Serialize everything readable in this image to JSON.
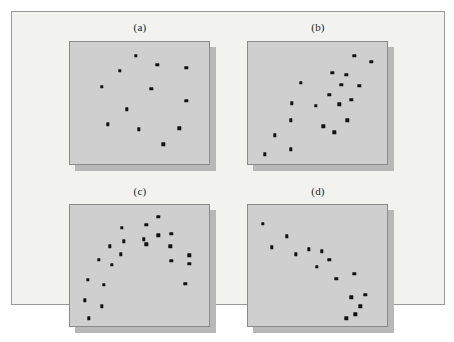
{
  "figure": {
    "background_color": "#f2f2f0",
    "panel_fill_color": "#cfcfcf",
    "panel_border_color": "#8a8a8a",
    "panel_shadow_color": "#b8b8b8",
    "point_color": "#111111"
  },
  "chart_data": [
    {
      "type": "scatter",
      "title": "(a)",
      "panel_id": "a",
      "xlabel": "",
      "ylabel": "",
      "xlim": [
        0,
        100
      ],
      "ylim": [
        0,
        100
      ],
      "grid": false,
      "legend": "none",
      "annotation": "no correlation / random scatter",
      "n_points": 12,
      "points": [
        {
          "x": 47.5,
          "y": 88.6
        },
        {
          "x": 62.9,
          "y": 81.3
        },
        {
          "x": 83.6,
          "y": 78.9
        },
        {
          "x": 35.7,
          "y": 76.4
        },
        {
          "x": 22.9,
          "y": 63.4
        },
        {
          "x": 58.6,
          "y": 61.8
        },
        {
          "x": 83.6,
          "y": 52.0
        },
        {
          "x": 40.7,
          "y": 44.7
        },
        {
          "x": 27.1,
          "y": 32.5
        },
        {
          "x": 49.3,
          "y": 28.5
        },
        {
          "x": 78.6,
          "y": 29.3
        },
        {
          "x": 67.1,
          "y": 16.3
        }
      ]
    },
    {
      "type": "scatter",
      "title": "(b)",
      "panel_id": "b",
      "xlabel": "",
      "ylabel": "",
      "xlim": [
        0,
        100
      ],
      "ylim": [
        0,
        100
      ],
      "grid": false,
      "legend": "none",
      "annotation": "strong positive linear correlation",
      "n_points": 19,
      "points": [
        {
          "x": 76.4,
          "y": 88.6
        },
        {
          "x": 88.6,
          "y": 83.7
        },
        {
          "x": 60.7,
          "y": 74.8
        },
        {
          "x": 70.7,
          "y": 73.2
        },
        {
          "x": 37.9,
          "y": 66.7
        },
        {
          "x": 67.1,
          "y": 65.0
        },
        {
          "x": 80.0,
          "y": 64.2
        },
        {
          "x": 58.6,
          "y": 56.9
        },
        {
          "x": 74.3,
          "y": 52.8
        },
        {
          "x": 31.4,
          "y": 49.6
        },
        {
          "x": 48.6,
          "y": 47.9
        },
        {
          "x": 65.7,
          "y": 48.8
        },
        {
          "x": 30.7,
          "y": 35.8
        },
        {
          "x": 71.4,
          "y": 35.8
        },
        {
          "x": 54.3,
          "y": 30.9
        },
        {
          "x": 62.1,
          "y": 26.0
        },
        {
          "x": 19.3,
          "y": 23.6
        },
        {
          "x": 30.7,
          "y": 12.2
        },
        {
          "x": 12.1,
          "y": 8.1
        }
      ]
    },
    {
      "type": "scatter",
      "title": "(c)",
      "panel_id": "c",
      "xlabel": "",
      "ylabel": "",
      "xlim": [
        0,
        100
      ],
      "ylim": [
        0,
        100
      ],
      "grid": false,
      "legend": "none",
      "annotation": "curvilinear / inverted-U relationship",
      "n_points": 22,
      "points": [
        {
          "x": 63.6,
          "y": 90.2
        },
        {
          "x": 55.0,
          "y": 83.7
        },
        {
          "x": 37.1,
          "y": 81.3
        },
        {
          "x": 63.6,
          "y": 74.8
        },
        {
          "x": 72.9,
          "y": 76.4
        },
        {
          "x": 52.9,
          "y": 71.5
        },
        {
          "x": 38.6,
          "y": 69.9
        },
        {
          "x": 55.0,
          "y": 67.5
        },
        {
          "x": 72.1,
          "y": 65.9
        },
        {
          "x": 28.6,
          "y": 65.9
        },
        {
          "x": 36.4,
          "y": 59.3
        },
        {
          "x": 72.9,
          "y": 53.7
        },
        {
          "x": 85.7,
          "y": 58.5
        },
        {
          "x": 20.7,
          "y": 54.5
        },
        {
          "x": 85.7,
          "y": 51.2
        },
        {
          "x": 30.0,
          "y": 50.4
        },
        {
          "x": 12.9,
          "y": 38.2
        },
        {
          "x": 24.3,
          "y": 34.1
        },
        {
          "x": 82.9,
          "y": 34.9
        },
        {
          "x": 10.7,
          "y": 21.1
        },
        {
          "x": 22.9,
          "y": 16.3
        },
        {
          "x": 13.6,
          "y": 6.5
        }
      ]
    },
    {
      "type": "scatter",
      "title": "(d)",
      "panel_id": "d",
      "xlabel": "",
      "ylabel": "",
      "xlim": [
        0,
        100
      ],
      "ylim": [
        0,
        100
      ],
      "grid": false,
      "legend": "none",
      "annotation": "strong negative linear correlation",
      "n_points": 15,
      "points": [
        {
          "x": 10.7,
          "y": 84.6
        },
        {
          "x": 27.9,
          "y": 74.0
        },
        {
          "x": 17.1,
          "y": 65.0
        },
        {
          "x": 43.6,
          "y": 63.4
        },
        {
          "x": 53.2,
          "y": 61.8
        },
        {
          "x": 34.3,
          "y": 59.3
        },
        {
          "x": 58.6,
          "y": 54.5
        },
        {
          "x": 49.3,
          "y": 48.8
        },
        {
          "x": 63.6,
          "y": 39.0
        },
        {
          "x": 76.4,
          "y": 43.1
        },
        {
          "x": 74.3,
          "y": 23.6
        },
        {
          "x": 84.3,
          "y": 26.0
        },
        {
          "x": 80.7,
          "y": 16.3
        },
        {
          "x": 70.7,
          "y": 6.5
        },
        {
          "x": 77.1,
          "y": 9.8
        }
      ]
    }
  ]
}
